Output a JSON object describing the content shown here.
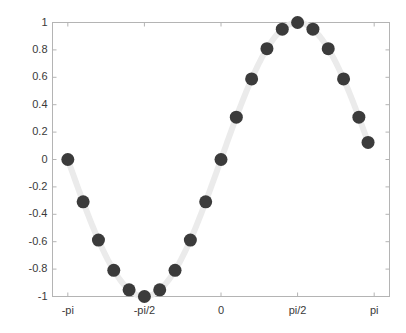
{
  "figure": {
    "background_color": "#ffffff",
    "axes_color": "#b4b4b4",
    "tick_label_color": "#3a3a3a",
    "line_color": "#ebebeb",
    "marker_color": "#3b3b3b"
  },
  "chart_data": {
    "type": "line",
    "title": "",
    "xlabel": "",
    "ylabel": "",
    "xlim": [
      -3.4557519189487724,
      3.4557519189487724
    ],
    "ylim": [
      -1,
      1
    ],
    "grid": false,
    "legend": null,
    "marker": "filled-circle",
    "marker_size_px": 13,
    "line_width_px": 6,
    "xticks": [
      -3.141592653589793,
      -1.5707963267948966,
      0,
      1.5707963267948966,
      3.141592653589793
    ],
    "xticklabels": [
      "-pi",
      "-pi/2",
      "0",
      "pi/2",
      "pi"
    ],
    "yticks": [
      1,
      0.8,
      0.6,
      0.4,
      0.2,
      0,
      -0.2,
      -0.4,
      -0.6,
      -0.8,
      -1
    ],
    "yticklabels": [
      "1",
      "0.8",
      "0.6",
      "0.4",
      "0.2",
      "0",
      "-0.2",
      "-0.4",
      "-0.6",
      "-0.8",
      "-1"
    ],
    "series": [
      {
        "name": "sin(x)",
        "x": [
          -3.141592653589793,
          -2.827433388230814,
          -2.5132741228718345,
          -2.199114857512855,
          -1.8849555921538759,
          -1.5707963267948966,
          -1.2566370614359172,
          -0.9424777960769379,
          -0.6283185307179586,
          -0.3141592653589793,
          0,
          0.3141592653589793,
          0.6283185307179586,
          0.9424777960769379,
          1.2566370614359172,
          1.5707963267948966,
          1.8849555921538759,
          2.199114857512855,
          2.5132741228718345,
          2.827433388230814,
          3.0159289474462017
        ],
        "y": [
          0,
          -0.309,
          -0.588,
          -0.809,
          -0.951,
          -1,
          -0.951,
          -0.809,
          -0.588,
          -0.309,
          0,
          0.309,
          0.588,
          0.809,
          0.951,
          1,
          0.951,
          0.809,
          0.588,
          0.309,
          0.125
        ]
      }
    ],
    "n_points": 21
  }
}
